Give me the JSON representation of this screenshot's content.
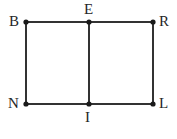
{
  "figure": {
    "background_color": "#ffffff",
    "stroke_color": "#333333",
    "label_color": "#262626",
    "vertices": [
      {
        "id": "B",
        "label": "B",
        "x": 26,
        "y": 22,
        "label_position": "left"
      },
      {
        "id": "E",
        "label": "E",
        "x": 89,
        "y": 22,
        "label_position": "above"
      },
      {
        "id": "R",
        "label": "R",
        "x": 153,
        "y": 22,
        "label_position": "right"
      },
      {
        "id": "N",
        "label": "N",
        "x": 26,
        "y": 104,
        "label_position": "left"
      },
      {
        "id": "I",
        "label": "I",
        "x": 89,
        "y": 104,
        "label_position": "below"
      },
      {
        "id": "L",
        "label": "L",
        "x": 153,
        "y": 104,
        "label_position": "right"
      }
    ],
    "segments": [
      {
        "id": "BR",
        "from": "B",
        "to": "R",
        "x1": 26,
        "y1": 22,
        "x2": 153,
        "y2": 22
      },
      {
        "id": "NL",
        "from": "N",
        "to": "L",
        "x1": 26,
        "y1": 104,
        "x2": 153,
        "y2": 104
      },
      {
        "id": "BN",
        "from": "B",
        "to": "N",
        "x1": 26,
        "y1": 22,
        "x2": 26,
        "y2": 104
      },
      {
        "id": "RL",
        "from": "R",
        "to": "L",
        "x1": 153,
        "y1": 22,
        "x2": 153,
        "y2": 104
      },
      {
        "id": "EI",
        "from": "E",
        "to": "I",
        "x1": 89,
        "y1": 22,
        "x2": 89,
        "y2": 104
      }
    ],
    "stroke_width": 2,
    "dot_radius": 2.6
  }
}
